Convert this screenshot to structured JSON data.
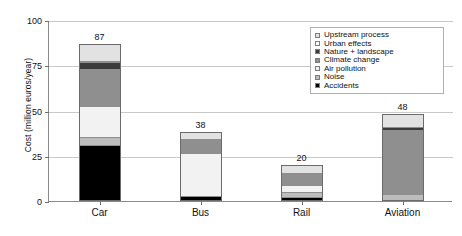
{
  "chart_data": {
    "type": "bar",
    "subtype": "stacked-vertical",
    "title": "",
    "xlabel": "",
    "ylabel": "Cost (million euros/year)",
    "ylim": [
      0,
      100
    ],
    "yticks": [
      0,
      25,
      50,
      75,
      100
    ],
    "ytick_labels": [
      "0",
      "25",
      "50",
      "75",
      "100"
    ],
    "grid": "horizontal",
    "legend_position": "top-right-inside",
    "categories": [
      "Car",
      "Bus",
      "Rail",
      "Aviation"
    ],
    "totals": [
      87,
      38,
      20,
      48
    ],
    "total_labels": [
      "87",
      "38",
      "20",
      "48"
    ],
    "series": [
      {
        "name": "Accidents",
        "color": "#000000",
        "values": [
          30,
          2,
          1,
          0
        ]
      },
      {
        "name": "Noise",
        "color": "#bcbcbc",
        "values": [
          4.5,
          0,
          3,
          3
        ]
      },
      {
        "name": "Air pollution",
        "color": "#f2f2f2",
        "values": [
          17.5,
          24,
          4,
          0
        ]
      },
      {
        "name": "Climate change",
        "color": "#8f8f8f",
        "values": [
          21,
          8,
          7,
          36
        ]
      },
      {
        "name": "Nature + landscape",
        "color": "#3b3b3b",
        "values": [
          3.5,
          0,
          0,
          2
        ]
      },
      {
        "name": "Urban effects",
        "color": "#fdfdfd",
        "values": [
          1,
          0,
          0,
          0
        ]
      },
      {
        "name": "Upstream process",
        "color": "#e2e2e2",
        "values": [
          9.5,
          4,
          5,
          7
        ]
      }
    ]
  },
  "legend": {
    "items": [
      {
        "label": "Upstream process",
        "color": "#e2e2e2"
      },
      {
        "label": "Urban effects",
        "color": "#fdfdfd"
      },
      {
        "label": "Nature + landscape",
        "color": "#3b3b3b"
      },
      {
        "label": "Climate change",
        "color": "#8f8f8f"
      },
      {
        "label": "Air pollution",
        "color": "#f2f2f2"
      },
      {
        "label": "Noise",
        "color": "#bcbcbc"
      },
      {
        "label": "Accidents",
        "color": "#000000"
      }
    ]
  },
  "axis": {
    "y_title": "Cost (million euros/year)"
  }
}
